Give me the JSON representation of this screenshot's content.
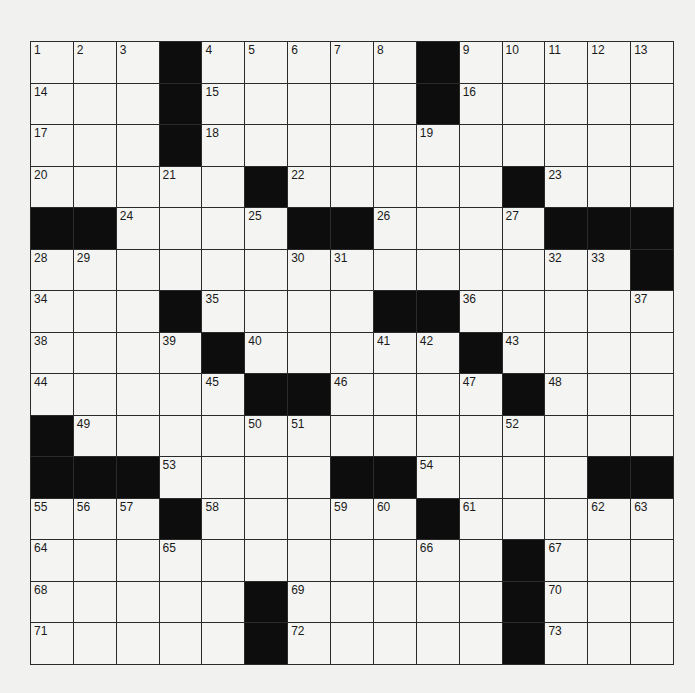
{
  "puzzle": {
    "rows": 15,
    "cols": 15,
    "colors": {
      "background": "#f1f1ef",
      "cell": "#f4f4f2",
      "block": "#0d0d0d",
      "line": "#2a2a2a"
    },
    "grid": [
      [
        "1",
        "2",
        "3",
        "#",
        "4",
        "5",
        "6",
        "7",
        "8",
        "#",
        "9",
        "10",
        "11",
        "12",
        "13"
      ],
      [
        "14",
        ".",
        ".",
        "#",
        "15",
        ".",
        ".",
        ".",
        ".",
        "#",
        "16",
        ".",
        ".",
        ".",
        "."
      ],
      [
        "17",
        ".",
        ".",
        "#",
        "18",
        ".",
        ".",
        ".",
        ".",
        "19",
        ".",
        ".",
        ".",
        ".",
        "."
      ],
      [
        "20",
        ".",
        ".",
        "21",
        ".",
        "#",
        "22",
        ".",
        ".",
        ".",
        ".",
        "#",
        "23",
        ".",
        "."
      ],
      [
        "#",
        "#",
        "24",
        ".",
        ".",
        "25",
        "#",
        "#",
        "26",
        ".",
        ".",
        "27",
        "#",
        "#",
        "#"
      ],
      [
        "28",
        "29",
        ".",
        ".",
        ".",
        ".",
        "30",
        "31",
        ".",
        ".",
        ".",
        ".",
        "32",
        "33",
        "#"
      ],
      [
        "34",
        ".",
        ".",
        "#",
        "35",
        ".",
        ".",
        ".",
        "#",
        "#",
        "36",
        ".",
        ".",
        ".",
        "37"
      ],
      [
        "38",
        ".",
        ".",
        "39",
        "#",
        "40",
        ".",
        ".",
        "41",
        "42",
        "#",
        "43",
        ".",
        ".",
        "."
      ],
      [
        "44",
        ".",
        ".",
        ".",
        "45",
        "#",
        "#",
        "46",
        ".",
        ".",
        "47",
        "#",
        "48",
        ".",
        "."
      ],
      [
        "#",
        "49",
        ".",
        ".",
        ".",
        "50",
        "51",
        ".",
        ".",
        ".",
        ".",
        "52",
        ".",
        ".",
        "."
      ],
      [
        "#",
        "#",
        "#",
        "53",
        ".",
        ".",
        ".",
        "#",
        "#",
        "54",
        ".",
        ".",
        ".",
        "#",
        "#"
      ],
      [
        "55",
        "56",
        "57",
        "#",
        "58",
        ".",
        ".",
        "59",
        "60",
        "#",
        "61",
        ".",
        ".",
        "62",
        "63"
      ],
      [
        "64",
        ".",
        ".",
        "65",
        ".",
        ".",
        ".",
        ".",
        ".",
        "66",
        ".",
        "#",
        "67",
        ".",
        "."
      ],
      [
        "68",
        ".",
        ".",
        ".",
        ".",
        "#",
        "69",
        ".",
        ".",
        ".",
        ".",
        "#",
        "70",
        ".",
        "."
      ],
      [
        "71",
        ".",
        ".",
        ".",
        ".",
        "#",
        "72",
        ".",
        ".",
        ".",
        ".",
        "#",
        "73",
        ".",
        "."
      ]
    ],
    "entries": []
  }
}
